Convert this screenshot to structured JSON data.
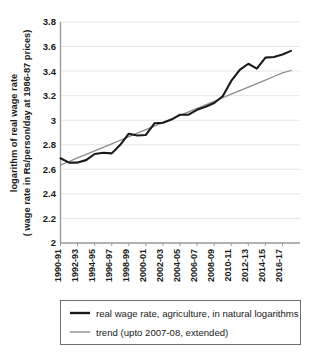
{
  "chart_data": {
    "type": "line",
    "title": "",
    "xlabel": "",
    "ylabel": "logarithm of real wage rate ( wage rate in Rs/person/day at 1986-87 prices)",
    "ylabel_line1": "logarithm of real wage rate",
    "ylabel_line2": "( wage rate in Rs/person/day at 1986-87 prices)",
    "ylim": [
      2,
      3.8
    ],
    "yticks": [
      "2",
      "2.2",
      "2.4",
      "2.6",
      "2.8",
      "3",
      "3.2",
      "3.4",
      "3.6",
      "3.8"
    ],
    "ytick_values": [
      2,
      2.2,
      2.4,
      2.6,
      2.8,
      3,
      3.2,
      3.4,
      3.6,
      3.8
    ],
    "grid": true,
    "legend_position": "bottom",
    "x": [
      "1990-91",
      "1991-92",
      "1992-93",
      "1993-94",
      "1994-95",
      "1995-96",
      "1996-97",
      "1997-98",
      "1998-99",
      "1999-00",
      "2000-01",
      "2001-02",
      "2002-03",
      "2003-04",
      "2004-05",
      "2005-06",
      "2006-07",
      "2007-08",
      "2008-09",
      "2009-10",
      "2010-11",
      "2011-12",
      "2012-13",
      "2013-14",
      "2014-15",
      "2015-16",
      "2016-17",
      "2017-18"
    ],
    "xticks": [
      "1990-91",
      "1992-93",
      "1994-95",
      "1996-97",
      "1998-99",
      "2000-01",
      "2002-03",
      "2004-05",
      "2006-07",
      "2008-09",
      "2010-11",
      "2012-13",
      "2014-15",
      "2016-17"
    ],
    "series": [
      {
        "name": "real wage rate, agriculture, in natural logarithms",
        "color": "#1a1a1a",
        "values": [
          2.69,
          2.655,
          2.655,
          2.675,
          2.725,
          2.735,
          2.73,
          2.8,
          2.89,
          2.875,
          2.88,
          2.975,
          2.98,
          3.005,
          3.045,
          3.045,
          3.085,
          3.11,
          3.14,
          3.195,
          3.32,
          3.41,
          3.46,
          3.42,
          3.51,
          3.515,
          3.535,
          3.565
        ]
      },
      {
        "name": "trend (upto 2007-08, extended)",
        "color": "#8c8c8c",
        "values": [
          2.635,
          2.664,
          2.693,
          2.722,
          2.75,
          2.779,
          2.808,
          2.837,
          2.866,
          2.895,
          2.923,
          2.952,
          2.981,
          3.01,
          3.039,
          3.068,
          3.096,
          3.125,
          3.154,
          3.183,
          3.212,
          3.241,
          3.269,
          3.298,
          3.327,
          3.356,
          3.385,
          3.405
        ]
      }
    ]
  },
  "legend": {
    "items": [
      {
        "label": "real wage rate, agriculture, in natural logarithms",
        "color": "#1a1a1a",
        "width": 2.1
      },
      {
        "label": "trend (upto 2007-08, extended)",
        "color": "#8c8c8c",
        "width": 1.3
      }
    ]
  }
}
